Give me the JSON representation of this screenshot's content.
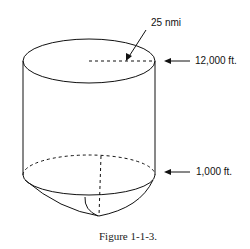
{
  "figure": {
    "caption": "Figure 1-1-3.",
    "labels": {
      "radius": "25 nmi",
      "top_altitude": "12,000 ft.",
      "bottom_altitude": "1,000 ft."
    },
    "shape": "cylinder-with-hemispherical-bottom",
    "stroke_color": "#111111",
    "background": "#ffffff"
  }
}
